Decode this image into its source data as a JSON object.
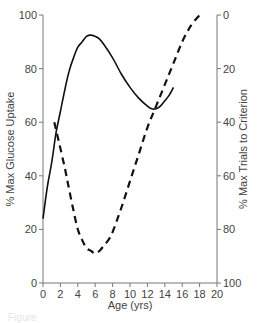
{
  "chart_data": {
    "type": "line",
    "title": "",
    "xlabel": "Age (yrs)",
    "ylabel": "% Max Glucose Uptake",
    "ylabel_right": "% Max Trials to Criterion",
    "xlim": [
      0,
      20
    ],
    "ylim": [
      0,
      100
    ],
    "ylim_right": [
      100,
      0
    ],
    "right_axis_inverted": true,
    "grid": false,
    "legend": null,
    "x_ticks": [
      "0",
      "2",
      "4",
      "6",
      "8",
      "10",
      "12",
      "14",
      "16",
      "18",
      "20"
    ],
    "y_ticks": [
      "0",
      "20",
      "40",
      "60",
      "80",
      "100"
    ],
    "y_ticks_right": [
      "0",
      "20",
      "40",
      "60",
      "80",
      "100"
    ],
    "series": [
      {
        "name": "% Max Glucose Uptake",
        "axis": "left",
        "style": "solid",
        "color": "#111111",
        "x": [
          0,
          0.5,
          1,
          1.5,
          2,
          2.5,
          3,
          3.5,
          4,
          4.5,
          5,
          5.5,
          6,
          6.5,
          7,
          8,
          9,
          10,
          11,
          12,
          12.5,
          13,
          13.5,
          14,
          14.5,
          15
        ],
        "values": [
          24,
          36,
          45,
          56,
          64,
          72,
          79,
          84,
          88,
          90,
          92,
          92.5,
          92,
          91,
          89,
          84,
          78,
          73,
          69,
          66,
          65,
          65,
          66,
          68,
          70,
          73
        ]
      },
      {
        "name": "% Max Trials to Criterion",
        "axis": "right",
        "style": "dashed",
        "color": "#111111",
        "x": [
          1.3,
          1.8,
          2.5,
          3,
          3.5,
          4,
          4.5,
          5,
          5.5,
          6,
          6.5,
          7,
          7.5,
          8,
          9,
          10,
          11,
          12,
          13,
          14,
          15,
          16,
          17,
          18
        ],
        "values": [
          40,
          47,
          57,
          65,
          73,
          80,
          84,
          87,
          88,
          89,
          88,
          86,
          84,
          81,
          72,
          62,
          52,
          42,
          34,
          26,
          18,
          10,
          4,
          0
        ]
      }
    ]
  },
  "caption": "Figure"
}
